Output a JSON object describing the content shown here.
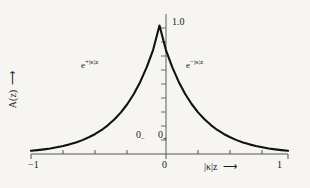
{
  "chart_data": {
    "type": "line",
    "title": "",
    "subtitle": "",
    "xlabel": "|κ|z ⟶",
    "ylabel": "A(z) ⟶",
    "xlim": [
      -1,
      1
    ],
    "ylim": [
      0,
      1.0
    ],
    "grid": false,
    "legend_position": "none",
    "x_ticks": [
      -1,
      -0.75,
      -0.5,
      -0.25,
      0,
      0.25,
      0.5,
      0.75,
      1
    ],
    "x_tick_labels": [
      "-1",
      "",
      "",
      "",
      "0",
      "",
      "",
      "",
      "1"
    ],
    "y_ticks": [
      0,
      0.1,
      0.2,
      0.3,
      0.4,
      0.5,
      0.6,
      0.7,
      0.8,
      0.9,
      1.0
    ],
    "y_tick_labels": [
      "",
      "",
      "",
      "",
      "",
      "",
      "",
      "",
      "",
      "",
      "1.0"
    ],
    "series": [
      {
        "name": "A(z) = e^{-|κ z|}",
        "x": [
          -1.0,
          -0.95,
          -0.9,
          -0.85,
          -0.8,
          -0.75,
          -0.7,
          -0.65,
          -0.6,
          -0.55,
          -0.5,
          -0.45,
          -0.4,
          -0.35,
          -0.3,
          -0.25,
          -0.2,
          -0.15,
          -0.1,
          -0.05,
          0.0,
          0.05,
          0.1,
          0.15,
          0.2,
          0.25,
          0.3,
          0.35,
          0.4,
          0.45,
          0.5,
          0.55,
          0.6,
          0.65,
          0.7,
          0.75,
          0.8,
          0.85,
          0.9,
          0.95,
          1.0
        ],
        "y": [
          0.025,
          0.03,
          0.036,
          0.043,
          0.052,
          0.062,
          0.075,
          0.09,
          0.108,
          0.13,
          0.156,
          0.187,
          0.225,
          0.27,
          0.324,
          0.389,
          0.467,
          0.561,
          0.674,
          0.809,
          1.0,
          0.809,
          0.674,
          0.561,
          0.467,
          0.389,
          0.324,
          0.27,
          0.225,
          0.187,
          0.156,
          0.13,
          0.108,
          0.09,
          0.075,
          0.062,
          0.052,
          0.043,
          0.036,
          0.03,
          0.025
        ]
      }
    ],
    "annotations": [
      {
        "text": "e^{+|κ|z}",
        "x": -0.47,
        "y": 0.62
      },
      {
        "text": "e^{-|κ|z}",
        "x": 0.22,
        "y": 0.62
      },
      {
        "text": "1.0",
        "x": 0.06,
        "y": 1.0
      },
      {
        "text": "0−",
        "x": -0.2,
        "y": 0.14
      },
      {
        "text": "0+",
        "x": -0.04,
        "y": 0.14
      }
    ]
  },
  "labels": {
    "peak_value": "1.0",
    "zero_minus_digit": "0",
    "zero_minus_sign": "−",
    "zero_plus_digit": "0",
    "zero_plus_sign": "+",
    "tick_left": "−1",
    "tick_zero": "0",
    "tick_right": "1"
  },
  "expressions": {
    "left_base": "e",
    "left_exponent": "+|κ|z",
    "right_base": "e",
    "right_exponent": "−|κ|z"
  },
  "axes": {
    "x_caption_text": "|κ|z",
    "x_caption_arrow": "⟶",
    "y_caption_text": "A(z)",
    "y_caption_arrow": "⟶"
  },
  "colors": {
    "background": "#f6f5f1",
    "curve": "#111111",
    "axis": "#555555",
    "text": "#1a1a1a"
  }
}
